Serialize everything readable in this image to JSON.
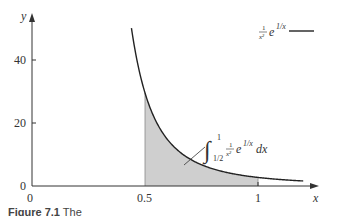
{
  "chart_data": {
    "type": "area",
    "title": "",
    "function": "(1/x^2) * e^(1/x)",
    "xlabel": "x",
    "ylabel": "y",
    "xlim": [
      0,
      1.25
    ],
    "ylim": [
      0,
      52
    ],
    "x_ticks": [
      {
        "value": 0,
        "label": "0"
      },
      {
        "value": 0.5,
        "label": "0.5"
      },
      {
        "value": 1,
        "label": "1"
      }
    ],
    "y_ticks": [
      {
        "value": 0,
        "label": "0"
      },
      {
        "value": 20,
        "label": "20"
      },
      {
        "value": 40,
        "label": "40"
      }
    ],
    "grid": false,
    "series": [
      {
        "name": "1/x² e^(1/x)",
        "x": [
          0.44,
          0.46,
          0.48,
          0.5,
          0.55,
          0.6,
          0.65,
          0.7,
          0.75,
          0.8,
          0.85,
          0.9,
          0.95,
          1.0,
          1.05,
          1.1,
          1.15,
          1.2
        ],
        "values": [
          50.1,
          41.0,
          35.0,
          29.6,
          20.3,
          14.7,
          11.0,
          8.6,
          6.8,
          5.4,
          4.5,
          3.7,
          3.2,
          2.7,
          2.4,
          2.1,
          1.8,
          1.6
        ]
      }
    ],
    "shaded_region": {
      "from": 0.5,
      "to": 1,
      "label": "∫ from 1/2 to 1 of (1/x²) e^(1/x) dx"
    },
    "legend": {
      "position": "top-right",
      "entries": [
        "1/x² e^(1/x)"
      ]
    },
    "annotations": [
      "∫_{1/2}^{1} (1/x²) e^{1/x} dx"
    ]
  },
  "legend": {
    "frac_num": "1",
    "frac_den": "x²",
    "exp_base": "e",
    "exp_power": "1/x"
  },
  "annotation": {
    "integral_sign": "∫",
    "upper": "1",
    "lower": "1/2",
    "frac_num": "1",
    "frac_den": "x²",
    "exp_base": "e",
    "exp_power": "1/x",
    "dx": "dx"
  },
  "axes": {
    "x_label": "x",
    "y_label": "y",
    "x_origin_label": "0",
    "x_tick_half": "0.5",
    "x_tick_one": "1",
    "y_tick_0": "0",
    "y_tick_20": "20",
    "y_tick_40": "40"
  },
  "caption": {
    "label": "Figure 7.1",
    "text": "The"
  }
}
